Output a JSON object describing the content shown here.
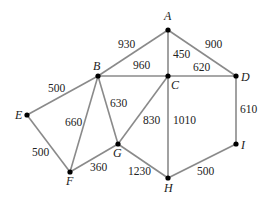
{
  "graph": {
    "nodes": [
      {
        "id": "A",
        "x": 168,
        "y": 30,
        "lx": 164,
        "ly": 20
      },
      {
        "id": "B",
        "x": 98,
        "y": 76,
        "lx": 93,
        "ly": 70
      },
      {
        "id": "C",
        "x": 168,
        "y": 76,
        "lx": 171,
        "ly": 89
      },
      {
        "id": "D",
        "x": 236,
        "y": 76,
        "lx": 241,
        "ly": 81
      },
      {
        "id": "E",
        "x": 27,
        "y": 115,
        "lx": 15,
        "ly": 119
      },
      {
        "id": "F",
        "x": 70,
        "y": 172,
        "lx": 66,
        "ly": 185
      },
      {
        "id": "G",
        "x": 118,
        "y": 144,
        "lx": 113,
        "ly": 157
      },
      {
        "id": "H",
        "x": 168,
        "y": 178,
        "lx": 164,
        "ly": 192
      },
      {
        "id": "I",
        "x": 236,
        "y": 144,
        "lx": 241,
        "ly": 149
      }
    ],
    "edges": [
      {
        "from": "A",
        "to": "B",
        "weight": "930",
        "wx": 118,
        "wy": 48
      },
      {
        "from": "A",
        "to": "C",
        "weight": "450",
        "wx": 173,
        "wy": 58
      },
      {
        "from": "A",
        "to": "D",
        "weight": "900",
        "wx": 205,
        "wy": 48
      },
      {
        "from": "B",
        "to": "C",
        "weight": "960",
        "wx": 133,
        "wy": 69
      },
      {
        "from": "C",
        "to": "D",
        "weight": "620",
        "wx": 193,
        "wy": 71
      },
      {
        "from": "B",
        "to": "E",
        "weight": "500",
        "wx": 48,
        "wy": 92
      },
      {
        "from": "B",
        "to": "F",
        "weight": "660",
        "wx": 65,
        "wy": 126
      },
      {
        "from": "B",
        "to": "G",
        "weight": "630",
        "wx": 110,
        "wy": 107
      },
      {
        "from": "C",
        "to": "G",
        "weight": "830",
        "wx": 143,
        "wy": 124
      },
      {
        "from": "C",
        "to": "H",
        "weight": "1010",
        "wx": 173,
        "wy": 124
      },
      {
        "from": "D",
        "to": "I",
        "weight": "610",
        "wx": 240,
        "wy": 113
      },
      {
        "from": "E",
        "to": "F",
        "weight": "500",
        "wx": 32,
        "wy": 156
      },
      {
        "from": "F",
        "to": "G",
        "weight": "360",
        "wx": 90,
        "wy": 171
      },
      {
        "from": "G",
        "to": "H",
        "weight": "1230",
        "wx": 128,
        "wy": 175
      },
      {
        "from": "H",
        "to": "I",
        "weight": "500",
        "wx": 197,
        "wy": 175
      }
    ]
  }
}
